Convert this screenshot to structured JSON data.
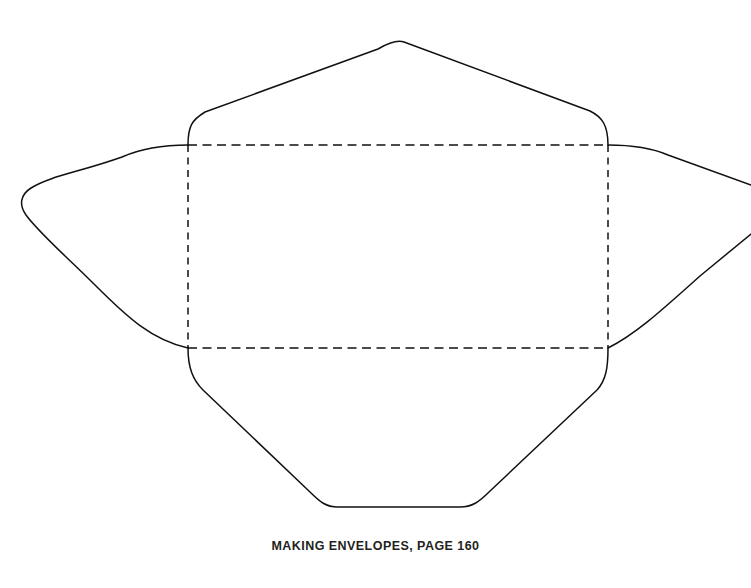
{
  "page": {
    "background_color": "#ffffff",
    "width": 751,
    "height": 588
  },
  "caption": {
    "text": "MAKING ENVELOPES, PAGE 160",
    "color": "#231f20"
  },
  "diagram": {
    "name": "envelope-template",
    "line_color": "#111111",
    "line_width": 1.5,
    "fold_rectangle": {
      "label": "fold-rectangle",
      "x": 188,
      "y": 145,
      "width": 420,
      "height": 203,
      "style": "dashed"
    },
    "flaps": [
      {
        "name": "top-flap",
        "style": "solid",
        "apex_x": 402,
        "apex_y": 42
      },
      {
        "name": "left-flap",
        "style": "solid",
        "apex_x": 22,
        "apex_y": 203
      },
      {
        "name": "right-flap",
        "style": "solid",
        "apex_x": 751,
        "apex_y": 210,
        "cropped": "true"
      },
      {
        "name": "bottom-flap",
        "style": "solid",
        "apex_y": 507
      }
    ],
    "paths": {
      "top_flap": "M 188 145 C 188 126, 192 120, 205 112 L 378 49 C 390 42, 398 40, 404 42 L 590 111 C 602 117, 608 125, 608 145",
      "left_flap": "M 188 145 C 160 145, 140 149, 122 157 C 80 172, 50 176, 31 188 C 20 195, 19 205, 26 215 C 40 234, 66 256, 95 285 C 128 318, 152 340, 188 348",
      "right_flap_upper": "M 608 145 C 634 145, 652 148, 668 155 L 751 185",
      "right_flap_lower": "M 751 234 L 700 276 C 662 310, 636 334, 608 348",
      "bottom_flap": "M 188 348 C 188 368, 193 380, 203 390 L 310 492 C 320 502, 326 507, 338 507 L 460 507 C 472 507, 479 502, 489 492 L 597 390 C 606 380, 608 368, 608 348",
      "fold_top": "M 188 145 L 608 145",
      "fold_bottom": "M 188 348 L 608 348",
      "fold_left": "M 188 145 L 188 348",
      "fold_right": "M 608 145 L 608 348"
    }
  }
}
